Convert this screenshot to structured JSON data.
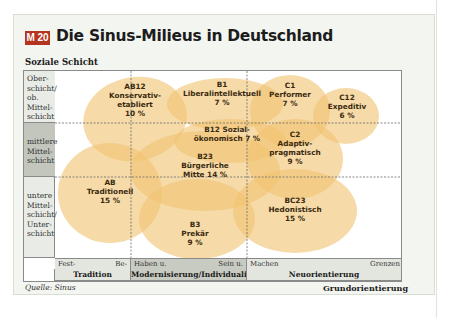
{
  "badge": "M 20",
  "title": "Die Sinus-Milieus in Deutschland",
  "y_axis_title": "Soziale Schicht",
  "x_axis_title": "Grundorientierung",
  "source": "Quelle: Sinus",
  "rows": [
    {
      "label": "Ober-\nschicht/\nob. Mittel-\nschicht"
    },
    {
      "label": "mittlere\nMittel-\nschicht"
    },
    {
      "label": "untere\nMittel-\nschicht/\nUnter-\nschicht"
    }
  ],
  "columns": [
    {
      "left": "Fest-\nhalten",
      "right": "Be-\nwahren",
      "band": "Tradition"
    },
    {
      "left": "Haben u.\nGenießen",
      "right": "Sein u.\nVerändern",
      "band": "Modernisierung/Individualisierung"
    },
    {
      "left": "Machen\nu. erleben",
      "right": "Grenzen\nüberwinden",
      "band": "Neuorientierung"
    }
  ],
  "colors": {
    "bubble": "#f0c373",
    "bubble_dark": "#e8b45c",
    "badge": "#b5341f"
  },
  "chart_data": {
    "type": "bubble-map",
    "title": "Die Sinus-Milieus in Deutschland",
    "xlabel": "Grundorientierung",
    "ylabel": "Soziale Schicht",
    "x_categories": [
      "Tradition",
      "Modernisierung/Individualisierung",
      "Neuorientierung"
    ],
    "y_categories": [
      "Oberschicht/ob. Mittelschicht",
      "mittlere Mittelschicht",
      "untere Mittelschicht/Unterschicht"
    ],
    "milieus": [
      {
        "code": "AB12",
        "name": "Konservativ-etabliert",
        "share_pct": 10
      },
      {
        "code": "B1",
        "name": "Liberalintellektuell",
        "share_pct": 7
      },
      {
        "code": "C1",
        "name": "Performer",
        "share_pct": 7
      },
      {
        "code": "C12",
        "name": "Expeditiv",
        "share_pct": 6
      },
      {
        "code": "B12",
        "name": "Sozialökonomisch",
        "share_pct": 7
      },
      {
        "code": "C2",
        "name": "Adaptiv-pragmatisch",
        "share_pct": 9
      },
      {
        "code": "B23",
        "name": "Bürgerliche Mitte",
        "share_pct": 14
      },
      {
        "code": "AB",
        "name": "Traditionell",
        "share_pct": 15
      },
      {
        "code": "BC23",
        "name": "Hedonistisch",
        "share_pct": 15
      },
      {
        "code": "B3",
        "name": "Prekär",
        "share_pct": 9
      }
    ],
    "labels": [
      [
        "AB12",
        "Konservativ-",
        "etabliert",
        "10 %"
      ],
      [
        "B1",
        "Liberalintellektuell",
        "7 %"
      ],
      [
        "C1",
        "Performer",
        "7 %"
      ],
      [
        "C12",
        "Expeditiv",
        "6 %"
      ],
      [
        "B12 Sozial-",
        "ökonomisch 7 %"
      ],
      [
        "C2",
        "Adaptiv-",
        "pragmatisch",
        "9 %"
      ],
      [
        "B23",
        "Bürgerliche",
        "Mitte 14 %"
      ],
      [
        "AB",
        "Traditionell",
        "15 %"
      ],
      [
        "BC23",
        "Hedonistisch",
        "15 %"
      ],
      [
        "B3",
        "Prekär",
        "9 %"
      ]
    ]
  }
}
